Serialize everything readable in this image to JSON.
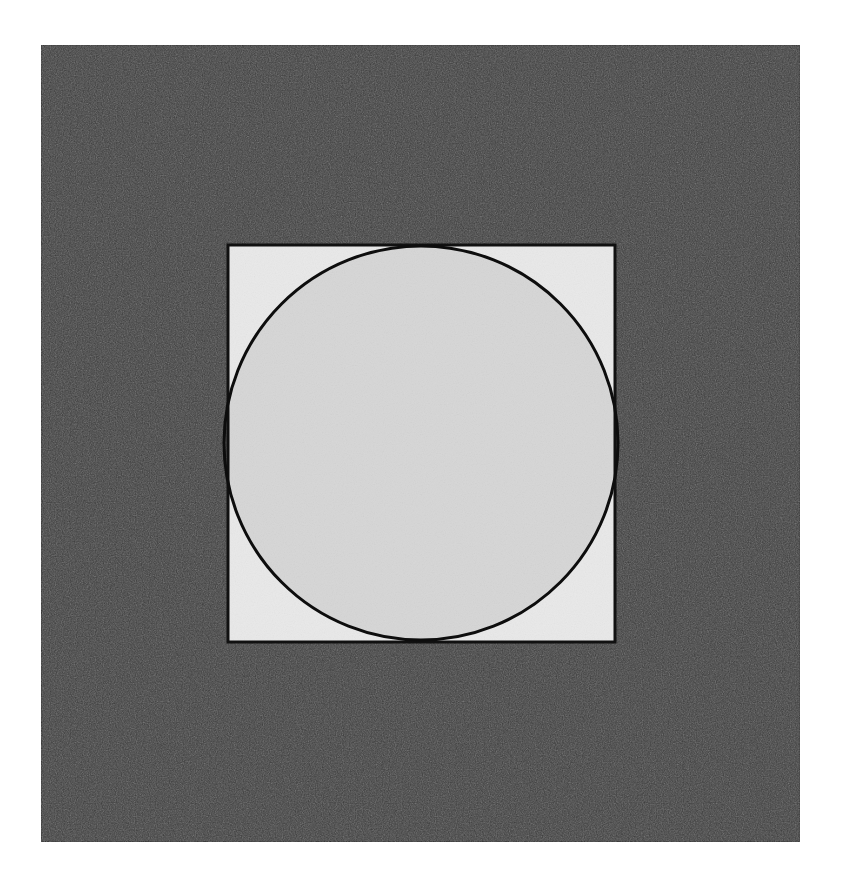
{
  "canvas": {
    "width": 841,
    "height": 884,
    "background_color": "#ffffff"
  },
  "figure": {
    "shapes": [
      {
        "name": "outer-panel",
        "type": "rect",
        "x": 41,
        "y": 45,
        "width": 759,
        "height": 797,
        "fill_color": "#3d3d3d",
        "stroke_color": "#2a2a2a",
        "stroke_width": 2
      },
      {
        "name": "inner-square",
        "type": "rect",
        "x": 228,
        "y": 245,
        "width": 387,
        "height": 397,
        "fill_color": "#e9e9e9",
        "stroke_color": "#111111",
        "stroke_width": 3
      },
      {
        "name": "inscribed-circle",
        "type": "circle",
        "cx": 421,
        "cy": 443,
        "r": 197,
        "fill_color": "#d6d6d6",
        "stroke_color": "#0d0d0d",
        "stroke_width": 3
      }
    ],
    "colors": {
      "page_background": "#ffffff",
      "panel_gray": "#3d3d3d",
      "square_light_gray": "#e9e9e9",
      "circle_fill_gray": "#d6d6d6",
      "outline_black": "#0d0d0d"
    },
    "texture": {
      "name": "film-grain-noise",
      "enabled": true,
      "opacity": 0.16
    }
  }
}
